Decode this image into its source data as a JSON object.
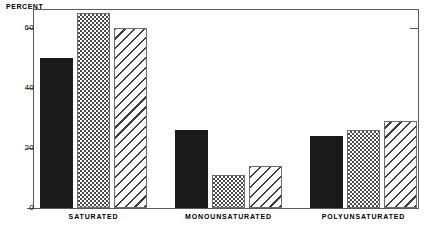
{
  "chart_data": {
    "type": "bar",
    "title": "",
    "xlabel": "",
    "ylabel": "PERCENT",
    "ylim": [
      0,
      70
    ],
    "yticks": [
      0,
      20,
      40,
      60
    ],
    "grid": false,
    "legend": "none",
    "categories": [
      "SATURATED",
      "MONOUNSATURATED",
      "POLYUNSATURATED"
    ],
    "series": [
      {
        "name": "solid-black",
        "pattern": "solid",
        "values": [
          50,
          26,
          24
        ]
      },
      {
        "name": "checkered",
        "pattern": "checkerboard",
        "values": [
          65,
          11,
          26
        ]
      },
      {
        "name": "diagonal-hatch",
        "pattern": "diagonal-hatch",
        "values": [
          60,
          14,
          29
        ]
      }
    ]
  },
  "axis": {
    "y_title": "PERCENT",
    "tick_labels": [
      "60",
      "40",
      "20",
      "0"
    ]
  },
  "categories": {
    "c0": "SATURATED",
    "c1": "MONOUNSATURATED",
    "c2": "POLYUNSATURATED"
  },
  "colors": {
    "solid_fill": "#1a1a1a",
    "pattern_ink": "#4a4a4a",
    "frame": "#5a5a5a",
    "background": "#ffffff"
  }
}
